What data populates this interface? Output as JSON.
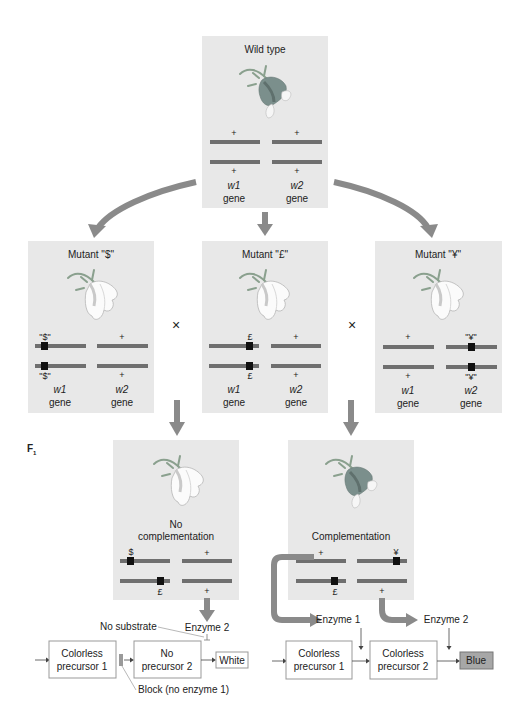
{
  "colors": {
    "panel": "#e8e8e8",
    "chromosome": "#6f6f6f",
    "mutation_marker": "#111111",
    "big_arrow": "#8a8a8a",
    "flower_colored": "#7b8f8c",
    "flower_white": "#fbfbfb",
    "blue_result": "#a7a7a7"
  },
  "parents": {
    "wild_type": {
      "title": "Wild type",
      "flower": "colored-flower-icon",
      "w1_top": "+",
      "w1_bottom": "+",
      "w2_top": "+",
      "w2_bottom": "+",
      "gene1_name": "w1",
      "gene2_name": "w2",
      "gene_word": "gene"
    },
    "mutant_dollar": {
      "title": "Mutant \"$\"",
      "flower": "white-flower-icon",
      "w1_top": "\"$\"",
      "w1_bottom": "\"$\"",
      "w2_top": "+",
      "w2_bottom": "+",
      "gene1_name": "w1",
      "gene2_name": "w2",
      "gene_word": "gene"
    },
    "mutant_pound": {
      "title": "Mutant \"£\"",
      "flower": "white-flower-icon",
      "w1_top": "£",
      "w1_bottom": "£",
      "w2_top": "+",
      "w2_bottom": "+",
      "gene1_name": "w1",
      "gene2_name": "w2",
      "gene_word": "gene"
    },
    "mutant_yen": {
      "title": "Mutant \"¥\"",
      "flower": "white-flower-icon",
      "w1_top": "+",
      "w1_bottom": "+",
      "w2_top": "\"¥\"",
      "w2_bottom": "\"¥\"",
      "gene1_name": "w1",
      "gene2_name": "w2",
      "gene_word": "gene"
    }
  },
  "cross_symbol": "×",
  "f1": {
    "label": "F",
    "label_sub": "1",
    "no_complementation": {
      "title_line1": "No",
      "title_line2": "complementation",
      "flower": "white-flower-icon",
      "w1_top": "$",
      "w1_bottom": "£",
      "w2_top": "+",
      "w2_bottom": "+"
    },
    "complementation": {
      "title": "Complementation",
      "flower": "colored-flower-icon",
      "w1_top": "+",
      "w1_bottom": "£",
      "w2_top": "¥",
      "w2_bottom": "+"
    }
  },
  "pathway_left": {
    "box1_line1": "Colorless",
    "box1_line2": "precursor 1",
    "box2_line1": "No",
    "box2_line2": "precursor 2",
    "result": "White",
    "enzyme2": "Enzyme 2",
    "no_substrate": "No substrate",
    "block": "Block (no enzyme 1)"
  },
  "pathway_right": {
    "box1_line1": "Colorless",
    "box1_line2": "precursor 1",
    "box2_line1": "Colorless",
    "box2_line2": "precursor 2",
    "result": "Blue",
    "enzyme1": "Enzyme 1",
    "enzyme2": "Enzyme 2"
  }
}
